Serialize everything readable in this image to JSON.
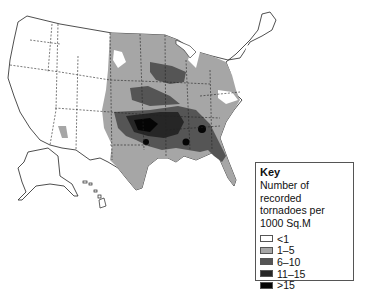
{
  "map": {
    "subject": "Tornado frequency in the United States",
    "regions_shown": [
      "Contiguous United States",
      "Alaska",
      "Hawaii"
    ]
  },
  "key": {
    "title": "Key",
    "description": "Number of recorded tornadoes per 1000 Sq.M",
    "items": [
      {
        "label": "<1",
        "color": "#ffffff"
      },
      {
        "label": "1–5",
        "color": "#a6a6a6"
      },
      {
        "label": "6–10",
        "color": "#555555"
      },
      {
        "label": "11–15",
        "color": "#262626"
      },
      {
        "label": ">15",
        "color": "#050505"
      }
    ]
  }
}
